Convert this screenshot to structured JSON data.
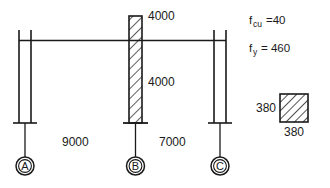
{
  "figure": {
    "line_color": "#1a1a1a",
    "text_color": "#1a1a1a",
    "background": "#ffffff"
  },
  "dimensions": {
    "column_b_upper_height": "4000",
    "column_b_lower_height": "4000",
    "span_ab": "9000",
    "span_bc": "7000"
  },
  "materials": {
    "fcu_symbol": "f",
    "fcu_subscript": "cu",
    "fcu_equals": "=40",
    "fy_symbol": "f",
    "fy_subscript": "y",
    "fy_equals": "= 460"
  },
  "section": {
    "width_label": "380",
    "height_label": "380"
  },
  "grid": {
    "marks": [
      {
        "label": "A"
      },
      {
        "label": "B"
      },
      {
        "label": "C"
      }
    ]
  }
}
